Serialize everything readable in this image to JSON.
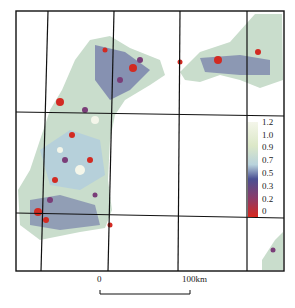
{
  "map": {
    "frame": {
      "x": 16,
      "y": 11,
      "w": 268,
      "h": 260
    },
    "grid_lines": {
      "vertical": [
        [
          48,
          11,
          41,
          271
        ],
        [
          114,
          11,
          108,
          271
        ],
        [
          180,
          11,
          178,
          271
        ],
        [
          247,
          11,
          247,
          271
        ]
      ],
      "horizontal": [
        [
          16,
          112,
          284,
          116
        ],
        [
          16,
          213,
          284,
          218
        ]
      ]
    }
  },
  "legend": {
    "labels": [
      "1.2",
      "1.0",
      "0.9",
      "0.7",
      "0.5",
      "0.3",
      "0.2",
      "0"
    ],
    "colors": [
      "#f4f6ea",
      "#dce8c8",
      "#c6dcc4",
      "#b8d2dc",
      "#5a5f9e",
      "#3c3c80",
      "#8a3c6a",
      "#d8281e"
    ]
  },
  "scale_bar": {
    "start_label": "0",
    "end_label": "100km"
  },
  "palette": {
    "light": "#cfe0cf",
    "pale_blue": "#aecbe0",
    "navy": "#4a4f92",
    "purple": "#7a3d78",
    "red": "#d22a22"
  }
}
